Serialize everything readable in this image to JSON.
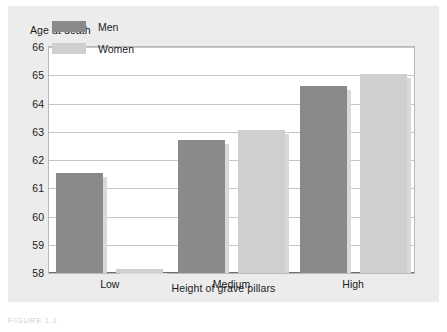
{
  "figure": {
    "caption": "FIGURE 1.1",
    "background_color": "#ececed",
    "plot_background_color": "#ffffff"
  },
  "chart_data": {
    "type": "bar",
    "title": "",
    "xlabel": "Height of grave pillars",
    "ylabel": "Age at death",
    "categories": [
      "Low",
      "Medium",
      "High"
    ],
    "series": [
      {
        "name": "Men",
        "color": "#8a8a8a",
        "values": [
          61.55,
          62.7,
          64.62
        ]
      },
      {
        "name": "Women",
        "color": "#cfcfcf",
        "values": [
          58.15,
          63.07,
          65.05
        ]
      }
    ],
    "ylim": [
      58,
      66
    ],
    "yticks": [
      66,
      65,
      64,
      63,
      62,
      61,
      60,
      59,
      58
    ],
    "ytick_labels": [
      "66",
      "65",
      "64",
      "63",
      "62",
      "61",
      "60",
      "59",
      "58"
    ],
    "grid": true,
    "legend_position": "top-left"
  }
}
